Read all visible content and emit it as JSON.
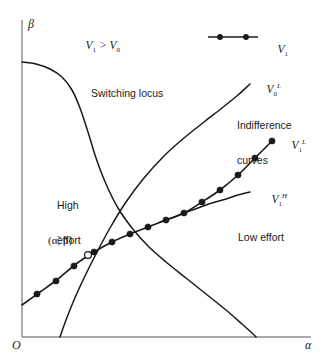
{
  "figure": {
    "type": "diagram",
    "background": "#ffffff",
    "ink": "#1a1a1a",
    "width": 327,
    "height": 362
  },
  "axes": {
    "y_label": "β",
    "x_label": "α",
    "origin_label": "O",
    "y_axis": {
      "x": 22,
      "y_top": 20,
      "y_bottom": 337
    },
    "x_axis": {
      "y": 337,
      "x_left": 22,
      "x_right": 311
    }
  },
  "legend": {
    "label": "V",
    "label_sub": "1",
    "marker": "filled-circle-line",
    "line_x1": 208,
    "line_x2": 258,
    "line_y": 37,
    "dots": [
      220,
      246
    ],
    "text_x": 266,
    "text_y": 31
  },
  "annotations": {
    "region_condition": {
      "text": "V",
      "sub1": "1",
      "rel": " > ",
      "text2": "V",
      "sub2": "0",
      "x": 74,
      "y": 33
    },
    "switching_locus": {
      "text": "Switching locus",
      "x": 91,
      "y": 88
    },
    "indifference_curves": {
      "line1": "Indifference",
      "line2": "curves",
      "x": 237,
      "y": 98
    },
    "high_effort": {
      "line1": "High",
      "line2": "effort",
      "x": 57,
      "y": 178
    },
    "low_effort": {
      "text": "Low effort",
      "x": 238,
      "y": 232
    },
    "equilibrium_point": {
      "text": "(α̃, β̃)",
      "x": 50,
      "y": 237
    }
  },
  "curve_labels": {
    "v0_low": {
      "base": "V",
      "sub": "0",
      "sup": "L",
      "x": 255,
      "y": 73
    },
    "v1_low": {
      "base": "V",
      "sub": "1",
      "sup": "L",
      "x": 278,
      "y": 128
    },
    "v1_high": {
      "base": "V",
      "sub": "1",
      "sup": "H",
      "x": 258,
      "y": 182
    }
  },
  "chart_data": {
    "type": "line",
    "title": "",
    "xlabel": "α",
    "ylabel": "β",
    "grid": false,
    "legend_position": "top-right",
    "series": [
      {
        "name": "Switching locus",
        "style": "solid",
        "points": [
          [
            22,
            62
          ],
          [
            36,
            64
          ],
          [
            50,
            69
          ],
          [
            62,
            77
          ],
          [
            72,
            90
          ],
          [
            80,
            108
          ],
          [
            88,
            132
          ],
          [
            96,
            158
          ],
          [
            106,
            184
          ],
          [
            118,
            208
          ],
          [
            132,
            228
          ],
          [
            148,
            246
          ],
          [
            166,
            262
          ],
          [
            186,
            278
          ],
          [
            206,
            294
          ],
          [
            226,
            310
          ],
          [
            242,
            324
          ],
          [
            252,
            333
          ],
          [
            256,
            337
          ]
        ]
      },
      {
        "name": "V0L",
        "style": "solid",
        "points": [
          [
            60,
            337
          ],
          [
            66,
            320
          ],
          [
            74,
            300
          ],
          [
            84,
            278
          ],
          [
            96,
            254
          ],
          [
            110,
            228
          ],
          [
            126,
            202
          ],
          [
            144,
            178
          ],
          [
            164,
            156
          ],
          [
            184,
            138
          ],
          [
            204,
            122
          ],
          [
            222,
            108
          ],
          [
            238,
            95
          ],
          [
            250,
            84
          ]
        ]
      },
      {
        "name": "V1L",
        "style": "solid-with-markers",
        "marker": "filled-circle",
        "points": [
          [
            22,
            305
          ],
          [
            40,
            292
          ],
          [
            58,
            279
          ],
          [
            76,
            264
          ],
          [
            94,
            252
          ],
          [
            112,
            242
          ],
          [
            130,
            234
          ],
          [
            148,
            227
          ],
          [
            166,
            220
          ],
          [
            184,
            213
          ],
          [
            202,
            202
          ],
          [
            220,
            190
          ],
          [
            238,
            175
          ],
          [
            255,
            158
          ],
          [
            272,
            141
          ]
        ],
        "markers": [
          [
            37,
            294
          ],
          [
            56,
            281
          ],
          [
            74,
            266
          ],
          [
            94,
            252
          ],
          [
            112,
            242
          ],
          [
            130,
            234
          ],
          [
            148,
            227
          ],
          [
            166,
            220
          ],
          [
            184,
            213
          ],
          [
            202,
            202
          ],
          [
            220,
            190
          ],
          [
            238,
            175
          ],
          [
            255,
            158
          ],
          [
            272,
            141
          ]
        ],
        "open_marker": [
          88,
          255
        ]
      },
      {
        "name": "V1H",
        "style": "solid",
        "points": [
          [
            160,
            222
          ],
          [
            172,
            218
          ],
          [
            184,
            213
          ],
          [
            198,
            208
          ],
          [
            212,
            203
          ],
          [
            226,
            199
          ],
          [
            238,
            195
          ],
          [
            250,
            192
          ]
        ]
      }
    ]
  }
}
